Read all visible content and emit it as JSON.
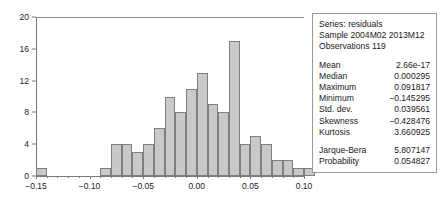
{
  "chart_data": {
    "type": "bar",
    "title": "",
    "xlabel": "",
    "ylabel": "",
    "grid": false,
    "legend": "none",
    "xlim": [
      -0.15,
      0.1
    ],
    "ylim": [
      0,
      20
    ],
    "bin_width": 0.01,
    "x_tick_labels": [
      "-0.15",
      "-0.10",
      "-0.05",
      "0.00",
      "0.05",
      "0.10"
    ],
    "x_tick_values": [
      -0.15,
      -0.1,
      -0.05,
      0.0,
      0.05,
      0.1
    ],
    "x_minor_step": 0.01,
    "y_tick_labels": [
      "0",
      "4",
      "8",
      "12",
      "16",
      "20"
    ],
    "y_tick_values": [
      0,
      4,
      8,
      12,
      16,
      20
    ],
    "bin_starts": [
      -0.15,
      -0.14,
      -0.13,
      -0.12,
      -0.11,
      -0.1,
      -0.09,
      -0.08,
      -0.07,
      -0.06,
      -0.05,
      -0.04,
      -0.03,
      -0.02,
      -0.01,
      0.0,
      0.01,
      0.02,
      0.03,
      0.04,
      0.05,
      0.06,
      0.07,
      0.08,
      0.09,
      0.1
    ],
    "values": [
      1,
      0,
      0,
      0,
      0,
      0,
      1,
      4,
      4,
      3,
      4,
      6,
      10,
      8,
      11,
      13,
      9,
      8,
      17,
      4,
      5,
      4,
      2,
      2,
      1,
      1
    ],
    "bar_fill": "#c9c9c9",
    "bar_border": "#7f7f7f"
  },
  "stats": {
    "series_line": "Series: residuals",
    "sample_line": "Sample 2004M02 2013M12",
    "observations_line": "Observations 119",
    "rows": [
      {
        "key": "Mean",
        "value": "2.66e-17"
      },
      {
        "key": "Median",
        "value": "0.000295"
      },
      {
        "key": "Maximum",
        "value": "0.091817"
      },
      {
        "key": "Minimum",
        "value": "−0.145295"
      },
      {
        "key": "Std. dev.",
        "value": "0.039561"
      },
      {
        "key": "Skewness",
        "value": "−0.428476"
      },
      {
        "key": "Kurtosis",
        "value": "3.660925"
      }
    ],
    "test_rows": [
      {
        "key": "Jarque-Bera",
        "value": "5.807147"
      },
      {
        "key": "Probability",
        "value": "0.054827"
      }
    ]
  }
}
